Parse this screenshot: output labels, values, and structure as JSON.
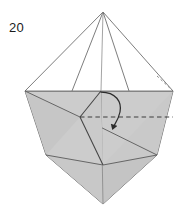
{
  "figure": {
    "kind": "origami-diagram",
    "step_label": "20",
    "caption": "",
    "colors": {
      "paper_front": "#cccccc",
      "paper_back": "#ffffff",
      "line": "#4a4a4a",
      "line_light": "#8c8c8c",
      "hidden_line": "#444444",
      "arrow": "#2b2b2b",
      "background": "#ffffff",
      "text": "#1b1b1b"
    },
    "canvas": {
      "width": 189,
      "height": 213
    },
    "vertices": {
      "apex": [
        103,
        12
      ],
      "left_shoulder": [
        25,
        91
      ],
      "right_shoulder": [
        173,
        91
      ],
      "center_top": [
        101,
        91
      ],
      "inner_left": [
        80,
        117
      ],
      "left_mid": [
        46,
        155
      ],
      "right_mid": [
        157,
        155
      ],
      "center_mid": [
        103,
        165
      ],
      "bottom": [
        103,
        204
      ]
    },
    "shapes": {
      "upper_cone": "apex-left_shoulder-right_shoulder fan, white back of paper",
      "lower_body": "left_shoulder-right_shoulder-right_mid-bottom-left_mid, shaded front of paper",
      "inner_flap": "center_top-inner_left-center_mid triangular flap"
    },
    "annotations": {
      "fold_arrow": {
        "type": "curved-arrow",
        "direction": "fold-down",
        "start": [
          101,
          92
        ],
        "end": [
          113,
          127
        ],
        "head": "solid-triangle"
      },
      "hidden_edges": [
        {
          "name": "horizontal-hidden-edge",
          "from": [
            80,
            117
          ],
          "to": [
            173,
            117
          ],
          "style": "dashed"
        },
        {
          "name": "upper-right-hidden-edge",
          "from": [
            158,
            77
          ],
          "to": [
            172,
            90
          ],
          "style": "dotted"
        }
      ]
    }
  }
}
